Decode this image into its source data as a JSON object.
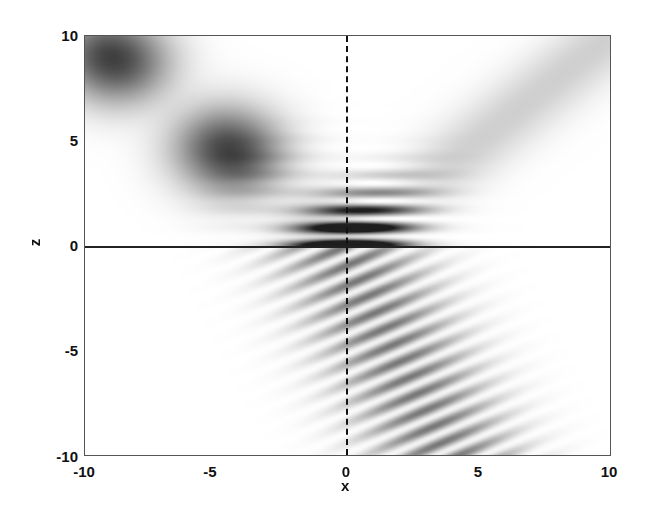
{
  "chart_data": {
    "type": "heatmap",
    "title": "",
    "xlabel": "x",
    "ylabel": "z",
    "xlim": [
      -10,
      10
    ],
    "ylim": [
      -10,
      10
    ],
    "x_ticks": [
      "-10",
      "-5",
      "0",
      "5",
      "10"
    ],
    "y_ticks": [
      "10",
      "5",
      "0",
      "-5",
      "-10"
    ],
    "colormap": "grayscale (dark = high intensity)",
    "annotations": [
      {
        "type": "solid horizontal line",
        "at": "z = 0",
        "description": "interface"
      },
      {
        "type": "dashed vertical line",
        "at": "x = 0"
      }
    ],
    "beams": [
      {
        "name": "incident",
        "region": "z>0, x<0",
        "direction": "from (-10,10) toward (0,0)",
        "relative_intensity": 1.0
      },
      {
        "name": "reflected",
        "region": "z>0, x>0",
        "direction": "from (0,0) toward (10,10)",
        "relative_intensity": 0.25
      },
      {
        "name": "transmitted",
        "region": "z<0",
        "direction": "from (0,0) toward (-4,-10)",
        "relative_intensity": 0.6
      }
    ],
    "grid": false,
    "legend": null
  }
}
